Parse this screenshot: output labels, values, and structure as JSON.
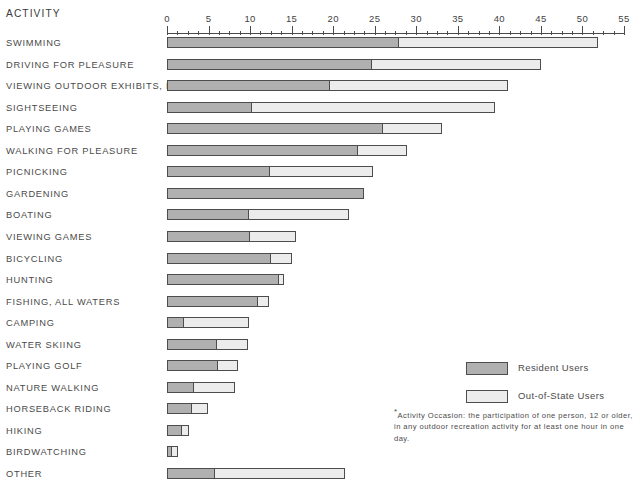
{
  "header": {
    "activity_column_label": "ACTIVITY"
  },
  "legend": {
    "position": "middle-right",
    "items": [
      {
        "label": "Resident Users",
        "color": "#b0b0b0",
        "swatch_name": "resident-swatch"
      },
      {
        "label": "Out-of-State Users",
        "color": "#ececec",
        "swatch_name": "out-of-state-swatch"
      }
    ]
  },
  "footnote": {
    "marker": "*",
    "line1": "Activity Occasion:  the participation of one person, 12 or older,",
    "line2": "in any outdoor recreation activity for at least one hour in one day."
  },
  "chart_data": {
    "type": "bar",
    "orientation": "horizontal",
    "stacked": true,
    "title": "",
    "subtitle": "",
    "xlabel": "",
    "ylabel": "ACTIVITY",
    "xlim": [
      0,
      55
    ],
    "grid": false,
    "legend_position": "middle-right",
    "axis": {
      "min": 0,
      "max": 55,
      "major_step": 5,
      "minor_step": 1.25,
      "tick_labels": [
        "0",
        "5",
        "10",
        "15",
        "20",
        "25",
        "30",
        "35",
        "40",
        "45",
        "50",
        "55"
      ],
      "tick_values": [
        0,
        5,
        10,
        15,
        20,
        25,
        30,
        35,
        40,
        45,
        50,
        55
      ]
    },
    "categories": [
      "SWIMMING",
      "DRIVING FOR PLEASURE",
      "VIEWING OUTDOOR EXHIBITS, ETC.",
      "SIGHTSEEING",
      "PLAYING GAMES",
      "WALKING FOR PLEASURE",
      "PICNICKING",
      "GARDENING",
      "BOATING",
      "VIEWING GAMES",
      "BICYCLING",
      "HUNTING",
      "FISHING, ALL WATERS",
      "CAMPING",
      "WATER SKIING",
      "PLAYING GOLF",
      "NATURE WALKING",
      "HORSEBACK RIDING",
      "HIKING",
      "BIRDWATCHING",
      "OTHER"
    ],
    "series": [
      {
        "name": "Resident Users",
        "color": "#b0b0b0",
        "values": [
          27.9,
          24.7,
          19.6,
          10.2,
          26.0,
          23.0,
          12.4,
          23.7,
          9.9,
          10.0,
          12.5,
          13.5,
          11.0,
          2.1,
          6.0,
          6.1,
          3.2,
          3.0,
          1.8,
          0.6,
          5.8
        ]
      },
      {
        "name": "Out-of-State Users",
        "color": "#ececec",
        "values": [
          24.0,
          20.3,
          21.4,
          29.3,
          7.1,
          5.9,
          12.4,
          0.0,
          12.0,
          5.5,
          2.5,
          0.6,
          1.3,
          7.8,
          3.7,
          2.4,
          5.0,
          1.9,
          0.8,
          0.7,
          15.6
        ]
      }
    ],
    "totals": [
      51.9,
      45.0,
      41.0,
      39.5,
      33.1,
      28.9,
      24.8,
      23.7,
      21.9,
      15.5,
      15.0,
      14.1,
      12.3,
      9.9,
      9.7,
      8.5,
      8.2,
      4.9,
      2.6,
      1.3,
      21.4
    ]
  },
  "rows": [
    {
      "label": "SWIMMING",
      "resident": 27.9,
      "visitor": 24.0,
      "total": 51.9
    },
    {
      "label": "DRIVING FOR PLEASURE",
      "resident": 24.7,
      "visitor": 20.3,
      "total": 45.0
    },
    {
      "label": "VIEWING OUTDOOR EXHIBITS, ETC.",
      "resident": 19.6,
      "visitor": 21.4,
      "total": 41.0
    },
    {
      "label": "SIGHTSEEING",
      "resident": 10.2,
      "visitor": 29.3,
      "total": 39.5
    },
    {
      "label": "PLAYING GAMES",
      "resident": 26.0,
      "visitor": 7.1,
      "total": 33.1
    },
    {
      "label": "WALKING FOR PLEASURE",
      "resident": 23.0,
      "visitor": 5.9,
      "total": 28.9
    },
    {
      "label": "PICNICKING",
      "resident": 12.4,
      "visitor": 12.4,
      "total": 24.8
    },
    {
      "label": "GARDENING",
      "resident": 23.7,
      "visitor": 0.0,
      "total": 23.7
    },
    {
      "label": "BOATING",
      "resident": 9.9,
      "visitor": 12.0,
      "total": 21.9
    },
    {
      "label": "VIEWING GAMES",
      "resident": 10.0,
      "visitor": 5.5,
      "total": 15.5
    },
    {
      "label": "BICYCLING",
      "resident": 12.5,
      "visitor": 2.5,
      "total": 15.0
    },
    {
      "label": "HUNTING",
      "resident": 13.5,
      "visitor": 0.6,
      "total": 14.1
    },
    {
      "label": "FISHING, ALL WATERS",
      "resident": 11.0,
      "visitor": 1.3,
      "total": 12.3
    },
    {
      "label": "CAMPING",
      "resident": 2.1,
      "visitor": 7.8,
      "total": 9.9
    },
    {
      "label": "WATER SKIING",
      "resident": 6.0,
      "visitor": 3.7,
      "total": 9.7
    },
    {
      "label": "PLAYING GOLF",
      "resident": 6.1,
      "visitor": 2.4,
      "total": 8.5
    },
    {
      "label": "NATURE WALKING",
      "resident": 3.2,
      "visitor": 5.0,
      "total": 8.2
    },
    {
      "label": "HORSEBACK RIDING",
      "resident": 3.0,
      "visitor": 1.9,
      "total": 4.9
    },
    {
      "label": "HIKING",
      "resident": 1.8,
      "visitor": 0.8,
      "total": 2.6
    },
    {
      "label": "BIRDWATCHING",
      "resident": 0.6,
      "visitor": 0.7,
      "total": 1.3
    },
    {
      "label": "OTHER",
      "resident": 5.8,
      "visitor": 15.6,
      "total": 21.4
    }
  ],
  "geometry": {
    "x0_px": 167,
    "px_per_unit": 8.309,
    "first_row_top_px": 36,
    "row_pitch_px": 21.55
  }
}
